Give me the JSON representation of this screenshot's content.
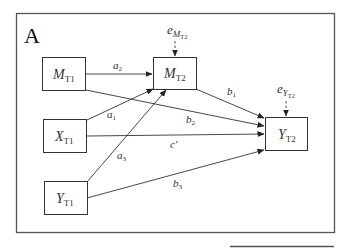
{
  "panel_label": "A",
  "nodes": {
    "m_t1": {
      "main": "M",
      "sub": "T1"
    },
    "x_t1": {
      "main": "X",
      "sub": "T1"
    },
    "y_t1": {
      "main": "Y",
      "sub": "T1"
    },
    "m_t2": {
      "main": "M",
      "sub": "T2"
    },
    "y_t2": {
      "main": "Y",
      "sub": "T2"
    }
  },
  "errors": {
    "e_m_t2": {
      "main": "e",
      "sub": "M",
      "subsub": "T2"
    },
    "e_y_t2": {
      "main": "e",
      "sub": "Y",
      "subsub": "T2"
    }
  },
  "paths": {
    "a1": {
      "main": "a",
      "sub": "1"
    },
    "a2": {
      "main": "a",
      "sub": "2"
    },
    "a3": {
      "main": "a",
      "sub": "3"
    },
    "b1": {
      "main": "b",
      "sub": "1"
    },
    "b2": {
      "main": "b",
      "sub": "2"
    },
    "b3": {
      "main": "b",
      "sub": "3"
    },
    "c_prime": {
      "main": "c'"
    }
  }
}
